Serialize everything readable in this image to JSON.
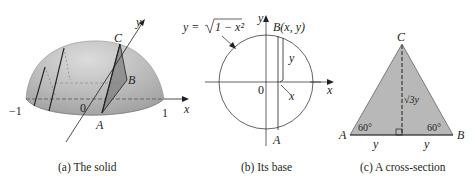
{
  "panels": [
    {
      "id": "a",
      "caption": "(a) The solid",
      "labels": {
        "y_axis": "y",
        "x_axis": "x",
        "neg_one": "−1",
        "origin": "0",
        "one": "1",
        "point_a": "A",
        "point_b": "B",
        "point_c": "C"
      }
    },
    {
      "id": "b",
      "caption": "(b) Its base",
      "labels": {
        "equation_lhs": "y = ",
        "equation_radicand": "1 − x²",
        "y_axis": "y",
        "x_axis": "x",
        "origin": "0",
        "point_b": "B(x, y)",
        "height": "y",
        "x_mark": "x",
        "point_a": "A"
      }
    },
    {
      "id": "c",
      "caption": "(c) A cross-section",
      "labels": {
        "point_a": "A",
        "point_b": "B",
        "point_c": "C",
        "angle_left": "60°",
        "angle_right": "60°",
        "height": "√3y",
        "half_base_left": "y",
        "half_base_right": "y"
      }
    }
  ],
  "colors": {
    "solid_fill": "#b3b3b3",
    "solid_highlight": "#d6d6d6",
    "triangle_fill": "#b8b8b8",
    "section_fill": "#8c8c8c",
    "line": "#231f20"
  }
}
